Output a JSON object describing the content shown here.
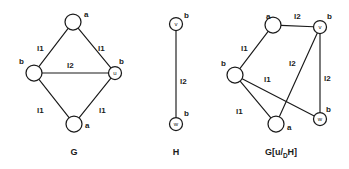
{
  "figure": {
    "width": 349,
    "height": 169,
    "background": "#ffffff",
    "ink_color": "#1a1a1a"
  },
  "panels": [
    {
      "id": "graph-g",
      "caption": "G",
      "caption_sub": "",
      "caption_tail": "",
      "caption_x": 74,
      "caption_y": 155,
      "nodes": [
        {
          "id": "g-top",
          "name": "",
          "label": "a",
          "cx": 73,
          "cy": 22,
          "r": 8,
          "lx": 84,
          "ly": 11
        },
        {
          "id": "g-left",
          "name": "",
          "label": "b",
          "cx": 34,
          "cy": 73,
          "r": 8,
          "lx": 19,
          "ly": 58
        },
        {
          "id": "g-u",
          "name": "u",
          "label": "b",
          "cx": 115,
          "cy": 73,
          "r": 6.5,
          "lx": 119,
          "ly": 58
        },
        {
          "id": "g-bottom",
          "name": "",
          "label": "a",
          "cx": 74,
          "cy": 124,
          "r": 8,
          "lx": 85,
          "ly": 122
        }
      ],
      "edges": [
        {
          "from": "g-left",
          "to": "g-top",
          "label": "l1",
          "lx": 37,
          "ly": 45
        },
        {
          "from": "g-top",
          "to": "g-u",
          "label": "l1",
          "lx": 98,
          "ly": 45
        },
        {
          "from": "g-left",
          "to": "g-u",
          "label": "l2",
          "lx": 67,
          "ly": 62
        },
        {
          "from": "g-left",
          "to": "g-bottom",
          "label": "l1",
          "lx": 37,
          "ly": 107
        },
        {
          "from": "g-bottom",
          "to": "g-u",
          "label": "l1",
          "lx": 99,
          "ly": 107
        }
      ]
    },
    {
      "id": "graph-h",
      "caption": "H",
      "caption_sub": "",
      "caption_tail": "",
      "caption_x": 176,
      "caption_y": 155,
      "nodes": [
        {
          "id": "h-v",
          "name": "v",
          "label": "b",
          "cx": 176,
          "cy": 24,
          "r": 6.5,
          "lx": 184,
          "ly": 12
        },
        {
          "id": "h-w",
          "name": "w",
          "label": "b",
          "cx": 176,
          "cy": 124,
          "r": 6.5,
          "lx": 184,
          "ly": 110
        }
      ],
      "edges": [
        {
          "from": "h-v",
          "to": "h-w",
          "label": "l2",
          "lx": 180,
          "ly": 78
        }
      ]
    },
    {
      "id": "graph-g-sub-h",
      "caption": "G[u/",
      "caption_sub": "D",
      "caption_tail": "H]",
      "caption_x": 281,
      "caption_y": 155,
      "nodes": [
        {
          "id": "s-topleft",
          "name": "",
          "label": "a",
          "cx": 273,
          "cy": 25,
          "r": 8,
          "lx": 266,
          "ly": 13
        },
        {
          "id": "s-v",
          "name": "v",
          "label": "b",
          "cx": 320,
          "cy": 27,
          "r": 6.5,
          "lx": 327,
          "ly": 13
        },
        {
          "id": "s-left",
          "name": "",
          "label": "b",
          "cx": 235,
          "cy": 75,
          "r": 8,
          "lx": 221,
          "ly": 60
        },
        {
          "id": "s-bottom",
          "name": "",
          "label": "a",
          "cx": 276,
          "cy": 124,
          "r": 8,
          "lx": 287,
          "ly": 124
        },
        {
          "id": "s-w",
          "name": "w",
          "label": "b",
          "cx": 320,
          "cy": 119,
          "r": 6.5,
          "lx": 326,
          "ly": 106
        }
      ],
      "edges": [
        {
          "from": "s-left",
          "to": "s-topleft",
          "label": "l1",
          "lx": 241,
          "ly": 45
        },
        {
          "from": "s-topleft",
          "to": "s-v",
          "label": "l2",
          "lx": 294,
          "ly": 13
        },
        {
          "from": "s-v",
          "to": "s-bottom",
          "label": "l2",
          "lx": 289,
          "ly": 60
        },
        {
          "from": "s-v",
          "to": "s-w",
          "label": "l2",
          "lx": 324,
          "ly": 75
        },
        {
          "from": "s-left",
          "to": "s-bottom",
          "label": "l1",
          "lx": 236,
          "ly": 108
        },
        {
          "from": "s-left",
          "to": "s-w",
          "label": "l1",
          "lx": 264,
          "ly": 76
        }
      ]
    }
  ]
}
